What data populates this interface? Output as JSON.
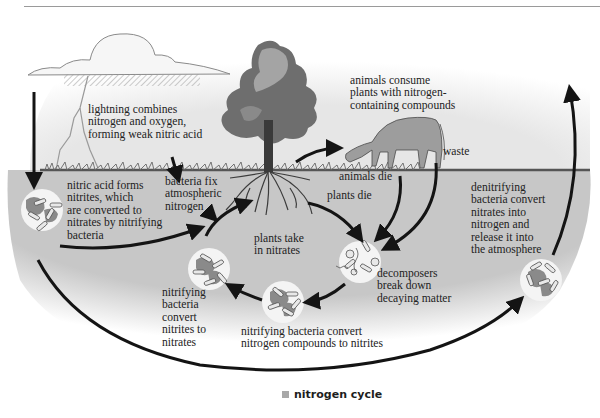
{
  "figure": {
    "caption_marker": "square-bullet",
    "caption": "nitrogen cycle",
    "colors": {
      "sky": "#e9e9e9",
      "soil": "#c9c9c9",
      "ground_line": "#555555",
      "arrow": "#141414",
      "bacteria_disc": "#f4f4f4",
      "caption_marker": "#a8a8a8"
    },
    "illustrations": [
      "cloud-icon",
      "lightning-icon",
      "tree-icon",
      "roots-icon",
      "cow-icon",
      "bacteria-cluster-icon"
    ],
    "labels": {
      "lightning": "lightning combines\nnitrogen and oxygen,\nforming weak nitric acid",
      "bacteria_fix": "bacteria fix\natmospheric\nnitrogen",
      "nitric_acid": "nitric acid forms\nnitrites, which\nare converted to\nnitrates by nitrifying\nbacteria",
      "animals_consume": "animals consume\nplants with nitrogen-\ncontaining compounds",
      "waste": "waste",
      "animals_die": "animals die",
      "plants_die": "plants die",
      "plants_take": "plants take\nin nitrates",
      "denitrifying": "denitrifying\nbacteria convert\nnitrates into\nnitrogen and\nrelease it into\nthe atmosphere",
      "decomposers": "decomposers\nbreak down\ndecaying matter",
      "nitrifying_left": "nitrifying\nbacteria\nconvert\nnitrites to\nnitrates",
      "nitrifying_bottom": "nitrifying bacteria convert\nnitrogen compounds to nitrites"
    }
  }
}
